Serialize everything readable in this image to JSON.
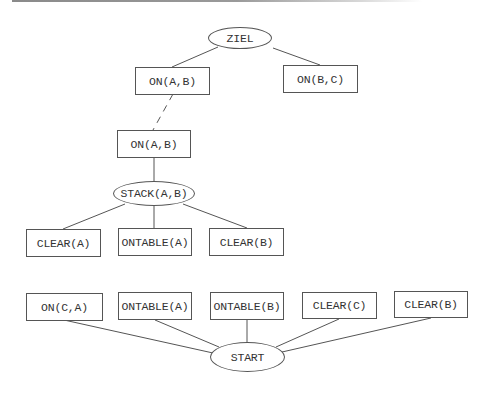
{
  "diagram": {
    "type": "planning-goal-tree",
    "nodes": {
      "goal": {
        "label": "ZIEL",
        "shape": "ellipse"
      },
      "goal_on_ab": {
        "label": "ON(A,B)",
        "shape": "box"
      },
      "goal_on_bc": {
        "label": "ON(B,C)",
        "shape": "box"
      },
      "sub_on_ab": {
        "label": "ON(A,B)",
        "shape": "box"
      },
      "stack_ab": {
        "label": "STACK(A,B)",
        "shape": "ellipse"
      },
      "pre_clear_a": {
        "label": "CLEAR(A)",
        "shape": "box"
      },
      "pre_ontable_a": {
        "label": "ONTABLE(A)",
        "shape": "box"
      },
      "pre_clear_b": {
        "label": "CLEAR(B)",
        "shape": "box"
      },
      "start_on_ca": {
        "label": "ON(C,A)",
        "shape": "box"
      },
      "start_ontable_a": {
        "label": "ONTABLE(A)",
        "shape": "box"
      },
      "start_ontable_b": {
        "label": "ONTABLE(B)",
        "shape": "box"
      },
      "start_clear_c": {
        "label": "CLEAR(C)",
        "shape": "box"
      },
      "start_clear_b": {
        "label": "CLEAR(B)",
        "shape": "box"
      },
      "start": {
        "label": "START",
        "shape": "ellipse"
      }
    },
    "edges": [
      {
        "from": "goal",
        "to": "goal_on_ab",
        "style": "solid"
      },
      {
        "from": "goal",
        "to": "goal_on_bc",
        "style": "solid"
      },
      {
        "from": "goal_on_ab",
        "to": "sub_on_ab",
        "style": "dashed"
      },
      {
        "from": "sub_on_ab",
        "to": "stack_ab",
        "style": "solid"
      },
      {
        "from": "stack_ab",
        "to": "pre_clear_a",
        "style": "solid"
      },
      {
        "from": "stack_ab",
        "to": "pre_ontable_a",
        "style": "solid"
      },
      {
        "from": "stack_ab",
        "to": "pre_clear_b",
        "style": "solid"
      },
      {
        "from": "start",
        "to": "start_on_ca",
        "style": "solid"
      },
      {
        "from": "start",
        "to": "start_ontable_a",
        "style": "solid"
      },
      {
        "from": "start",
        "to": "start_ontable_b",
        "style": "solid"
      },
      {
        "from": "start",
        "to": "start_clear_c",
        "style": "solid"
      },
      {
        "from": "start",
        "to": "start_clear_b",
        "style": "solid"
      }
    ],
    "colors": {
      "stroke": "#555555",
      "text": "#333333",
      "background": "#ffffff"
    }
  }
}
